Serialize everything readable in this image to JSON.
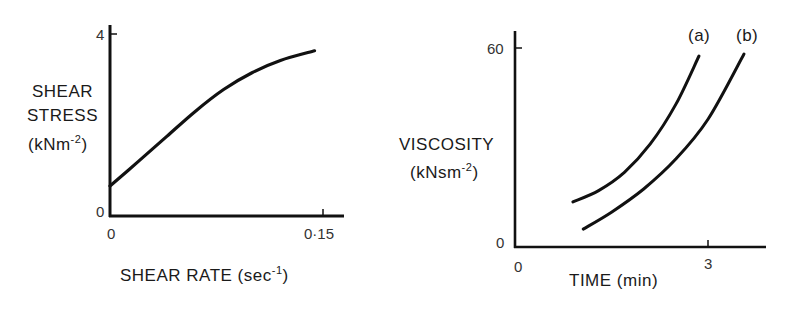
{
  "chart_data": [
    {
      "type": "line",
      "title": "",
      "xlabel": "SHEAR RATE (sec⁻¹)",
      "xlabel_base": "SHEAR RATE (sec",
      "xlabel_sup": "-1",
      "xlabel_close": ")",
      "ylabel_lines": [
        "SHEAR",
        "STRESS"
      ],
      "ylabel_unit_base": "(kNm",
      "ylabel_unit_sup": "-2",
      "ylabel_unit_close": ")",
      "xlim": [
        0,
        0.16
      ],
      "ylim": [
        0,
        4.2
      ],
      "x_ticks": [
        {
          "value": 0,
          "label": "0"
        },
        {
          "value": 0.15,
          "label": "0·15"
        }
      ],
      "y_ticks": [
        {
          "value": 0,
          "label": "0"
        },
        {
          "value": 4,
          "label": "4"
        }
      ],
      "grid": false,
      "series": [
        {
          "name": "shear stress",
          "x": [
            0,
            0.02,
            0.04,
            0.06,
            0.08,
            0.1,
            0.12,
            0.144
          ],
          "y": [
            0.66,
            1.2,
            1.75,
            2.3,
            2.78,
            3.15,
            3.42,
            3.63
          ]
        }
      ]
    },
    {
      "type": "line",
      "title": "",
      "xlabel": "TIME (min)",
      "ylabel": "VISCOSITY (kNsm⁻²)",
      "ylabel_line": "VISCOSITY",
      "ylabel_unit_base": "(kNsm",
      "ylabel_unit_sup": "-2",
      "ylabel_unit_close": ")",
      "xlim": [
        0,
        3.9
      ],
      "ylim": [
        0,
        65
      ],
      "x_ticks": [
        {
          "value": 0,
          "label": "0"
        },
        {
          "value": 3,
          "label": "3"
        }
      ],
      "y_ticks": [
        {
          "value": 0,
          "label": "0"
        },
        {
          "value": 60,
          "label": "60"
        }
      ],
      "grid": false,
      "series": [
        {
          "name": "(a)",
          "x": [
            0.9,
            1.3,
            1.7,
            2.1,
            2.5,
            2.86
          ],
          "y": [
            13.6,
            17.0,
            22.5,
            31.0,
            43.0,
            57.6
          ]
        },
        {
          "name": "(b)",
          "x": [
            1.06,
            1.5,
            2.0,
            2.5,
            3.0,
            3.56
          ],
          "y": [
            5.4,
            10.5,
            17.5,
            26.5,
            38.5,
            58.2
          ]
        }
      ]
    }
  ]
}
